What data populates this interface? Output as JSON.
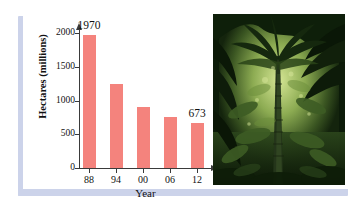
{
  "figure": {
    "name": "deforestation-bar-chart-with-rainforest-photo",
    "frame_color": "#ccd3ea",
    "background": "#ffffff"
  },
  "chart_data": {
    "type": "bar",
    "title": "",
    "xlabel": "Year",
    "ylabel": "Hectares (millions)",
    "categories": [
      "88",
      "94",
      "00",
      "06",
      "12"
    ],
    "values": [
      1970,
      1250,
      910,
      755,
      673
    ],
    "ylim": [
      0,
      2000
    ],
    "yticks": [
      0,
      500,
      1000,
      1500,
      2000
    ],
    "ytick_labels": [
      "0",
      "500",
      "1000",
      "1500",
      "2000"
    ],
    "grid": false,
    "legend": null,
    "bar_color": "#f4837d",
    "axis_color": "#3a3a3a",
    "annotations": [
      {
        "category": "88",
        "value": 1970,
        "label": "1970"
      },
      {
        "category": "12",
        "value": 673,
        "label": "673"
      }
    ]
  },
  "photo": {
    "name": "rainforest-photograph",
    "description": "Dense tropical rainforest with palm tree",
    "colors": {
      "dark": "#0c1b09",
      "mid": "#2f4a1e",
      "light": "#8fae57",
      "highlight": "#cfe08a"
    }
  }
}
